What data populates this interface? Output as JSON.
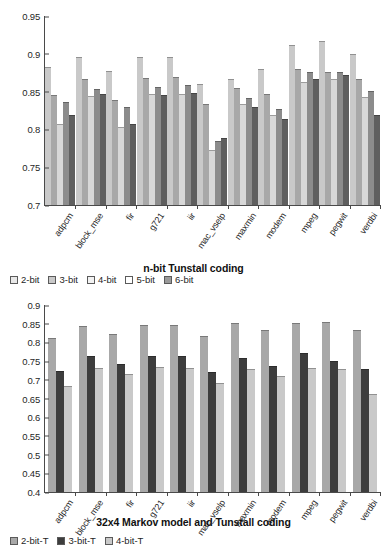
{
  "chart_data": [
    {
      "type": "bar",
      "title": "n-bit Tunstall coding",
      "xlabel": "",
      "ylabel": "",
      "ylim": [
        0.7,
        0.95
      ],
      "yticks": [
        "0.95",
        "0.9",
        "0.85",
        "0.8",
        "0.75",
        "0.7"
      ],
      "ytick_values": [
        0.95,
        0.9,
        0.85,
        0.8,
        0.75,
        0.7
      ],
      "grid": false,
      "legend_position": "below",
      "categories": [
        "adpcm",
        "block_mse",
        "fir",
        "g721",
        "iir",
        "mac_vselp",
        "maxmin",
        "modem",
        "mpeg",
        "pegwit",
        "verdbi"
      ],
      "series": [
        {
          "name": "2-bit",
          "color": "#c9c9c9",
          "values": [
            0.881,
            0.894,
            0.876,
            0.894,
            0.895,
            0.859,
            0.866,
            0.878,
            0.91,
            0.915,
            0.899
          ]
        },
        {
          "name": "3-bit",
          "color": "#a8a8a8",
          "values": [
            0.844,
            0.866,
            0.838,
            0.867,
            0.868,
            0.832,
            0.853,
            0.846,
            0.879,
            0.874,
            0.866
          ]
        },
        {
          "name": "4-bit",
          "color": "#d8d8d8",
          "values": [
            0.806,
            0.843,
            0.802,
            0.845,
            0.846,
            0.772,
            0.832,
            0.818,
            0.862,
            0.866,
            0.842
          ]
        },
        {
          "name": "5-bit",
          "color": "#8c8c8c",
          "values": [
            0.835,
            0.852,
            0.828,
            0.855,
            0.857,
            0.784,
            0.84,
            0.826,
            0.874,
            0.875,
            0.849
          ]
        },
        {
          "name": "6-bit",
          "color": "#5f5f5f",
          "values": [
            0.818,
            0.845,
            0.806,
            0.844,
            0.847,
            0.787,
            0.828,
            0.812,
            0.866,
            0.871,
            0.818
          ]
        }
      ]
    },
    {
      "type": "bar",
      "title": "32x4 Markov model and Tunstall coding",
      "xlabel": "",
      "ylabel": "",
      "ylim": [
        0.4,
        0.9
      ],
      "yticks": [
        "0.9",
        "0.85",
        "0.8",
        "0.75",
        "0.7",
        "0.65",
        "0.6",
        "0.55",
        "0.5",
        "0.45",
        "0.4"
      ],
      "ytick_values": [
        0.9,
        0.85,
        0.8,
        0.75,
        0.7,
        0.65,
        0.6,
        0.55,
        0.5,
        0.45,
        0.4
      ],
      "grid": false,
      "legend_position": "below",
      "categories": [
        "adpcm",
        "block_mse",
        "fir",
        "g721",
        "iir",
        "mac_vselp",
        "maxmin",
        "modem",
        "mpeg",
        "pegwit",
        "verdbi"
      ],
      "series": [
        {
          "name": "2-bit-T",
          "color": "#a8a8a8",
          "values": [
            0.81,
            0.84,
            0.82,
            0.845,
            0.845,
            0.815,
            0.85,
            0.83,
            0.85,
            0.852,
            0.83
          ]
        },
        {
          "name": "3-bit-T",
          "color": "#3d3d3d",
          "values": [
            0.72,
            0.76,
            0.74,
            0.762,
            0.762,
            0.718,
            0.755,
            0.735,
            0.768,
            0.748,
            0.725
          ]
        },
        {
          "name": "4-bit-T",
          "color": "#c9c9c9",
          "values": [
            0.68,
            0.73,
            0.712,
            0.732,
            0.73,
            0.69,
            0.725,
            0.708,
            0.73,
            0.726,
            0.66
          ]
        }
      ]
    }
  ],
  "charts": {
    "top": {
      "title": "n-bit Tunstall coding",
      "legend": [
        {
          "label": "2-bit",
          "color": "#e8e8e8"
        },
        {
          "label": "3-bit",
          "color": "#c9c9c9"
        },
        {
          "label": "4-bit",
          "color": "#f2f2f2"
        },
        {
          "label": "5-bit",
          "color": "#ffffff"
        },
        {
          "label": "6-bit",
          "color": "#9a9a9a"
        }
      ]
    },
    "bottom": {
      "title": "32x4 Markov model and Tunstall coding",
      "legend": [
        {
          "label": "2-bit-T",
          "color": "#a8a8a8"
        },
        {
          "label": "3-bit-T",
          "color": "#3d3d3d"
        },
        {
          "label": "4-bit-T",
          "color": "#c9c9c9"
        }
      ]
    }
  }
}
